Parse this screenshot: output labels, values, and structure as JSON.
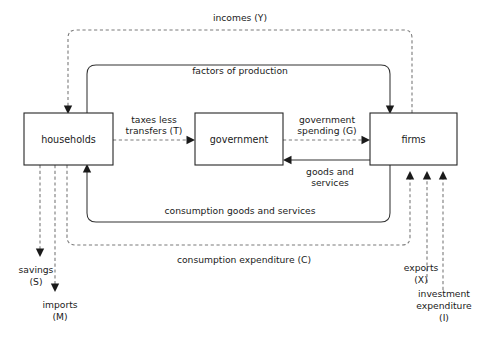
{
  "diagram": {
    "type": "economic-circular-flow",
    "nodes": [
      {
        "id": "households",
        "label": "households"
      },
      {
        "id": "government",
        "label": "government"
      },
      {
        "id": "firms",
        "label": "firms"
      }
    ],
    "flows": [
      {
        "id": "incomes",
        "label": "incomes (Y)",
        "style": "dashed",
        "from": "firms",
        "to": "households"
      },
      {
        "id": "factors",
        "label": "factors of production",
        "style": "solid",
        "from": "households",
        "to": "firms"
      },
      {
        "id": "taxes",
        "label_line1": "taxes less",
        "label_line2": "transfers (T)",
        "style": "dashed",
        "from": "households",
        "to": "government"
      },
      {
        "id": "govspending",
        "label_line1": "government",
        "label_line2": "spending (G)",
        "style": "dashed",
        "from": "government",
        "to": "firms"
      },
      {
        "id": "goodsservices",
        "label_line1": "goods and",
        "label_line2": "services",
        "style": "solid",
        "from": "firms",
        "to": "government"
      },
      {
        "id": "consumptiongoods",
        "label": "consumption goods and services",
        "style": "solid",
        "from": "firms",
        "to": "households"
      },
      {
        "id": "consumptionexpenditure",
        "label": "consumption expenditure (C)",
        "style": "dashed",
        "from": "households",
        "to": "firms"
      },
      {
        "id": "savings",
        "label_line1": "savings",
        "label_line2": "(S)",
        "style": "dashed",
        "from": "households",
        "to": "leakage"
      },
      {
        "id": "imports",
        "label_line1": "imports",
        "label_line2": "(M)",
        "style": "dashed",
        "from": "households",
        "to": "leakage"
      },
      {
        "id": "exports",
        "label_line1": "exports",
        "label_line2": "(X)",
        "style": "dashed",
        "from": "injection",
        "to": "firms"
      },
      {
        "id": "investment",
        "label_line1": "investment",
        "label_line2": "expenditure",
        "label_line3": "(I)",
        "style": "dashed",
        "from": "injection",
        "to": "firms"
      }
    ],
    "colors": {
      "box_stroke": "#262626",
      "solid_flow": "#333333",
      "dashed_flow": "#7a7a7a",
      "text": "#1a1a1a",
      "background": "#ffffff"
    }
  }
}
